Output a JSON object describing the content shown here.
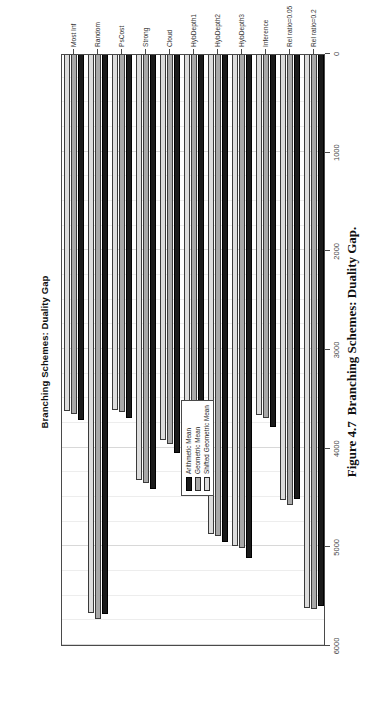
{
  "figure": {
    "caption_number": "Figure 4.7",
    "caption_text": "Branching Schemes: Duality Gap."
  },
  "chart_data": {
    "type": "bar",
    "orientation": "horizontal",
    "title": "Branching Schemes: Duality Gap",
    "xlabel": "",
    "ylabel": "",
    "xlim": [
      0,
      6000
    ],
    "xticks": [
      0,
      1000,
      2000,
      3000,
      4000,
      5000,
      6000
    ],
    "xticklabels": [
      "0",
      "1000",
      "2000",
      "3000",
      "4000",
      "5000",
      "6000"
    ],
    "grid": true,
    "grid_axis": "x",
    "legend_position": "center-left",
    "categories": [
      "Most Inf",
      "Random",
      "PsCost",
      "Strong",
      "Cloud",
      "HybDepth1",
      "HybDepth2",
      "HybDepth3",
      "Inference",
      "Rel ratio=0.05",
      "Rel ratio=0.2"
    ],
    "series": [
      {
        "name": "Arithmetic Mean",
        "color": "#1a1a1a",
        "values": [
          3720,
          5690,
          3700,
          4420,
          4050,
          3700,
          4960,
          5120,
          3790,
          4520,
          5600
        ]
      },
      {
        "name": "Geometric Mean",
        "color": "#a8a8a8",
        "values": [
          3660,
          5740,
          3640,
          4360,
          3960,
          3640,
          4900,
          5020,
          3700,
          4580,
          5640
        ]
      },
      {
        "name": "Shifted Geometric Mean",
        "color": "#dcdcdc",
        "values": [
          3630,
          5680,
          3620,
          4330,
          3920,
          3620,
          4880,
          5000,
          3670,
          4530,
          5620
        ]
      }
    ]
  }
}
